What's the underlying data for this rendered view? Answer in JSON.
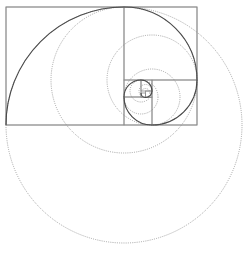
{
  "diagram": {
    "colors": {
      "background": "#ffffff",
      "rectangle_stroke": "#8a8a8a",
      "circle_stroke": "#9a9a9a",
      "spiral_stroke": "#4a4a4a"
    },
    "outer_rectangle": {
      "x": 6,
      "y": 7,
      "width": 191,
      "height": 118
    },
    "squares": [
      {
        "x": 6,
        "y": 7,
        "size": 118,
        "arc_center": [
          124,
          125
        ],
        "arc_start": [
          6,
          125
        ],
        "arc_end": [
          124,
          7
        ]
      },
      {
        "x": 124,
        "y": 7,
        "size": 73,
        "arc_center": [
          124,
          80
        ],
        "arc_start": [
          124,
          7
        ],
        "arc_end": [
          197,
          80
        ]
      },
      {
        "x": 152,
        "y": 80,
        "size": 45,
        "arc_center": [
          152,
          80
        ],
        "arc_start": [
          197,
          80
        ],
        "arc_end": [
          152,
          125
        ]
      },
      {
        "x": 124,
        "y": 97,
        "size": 28,
        "arc_center": [
          152,
          97
        ],
        "arc_start": [
          152,
          125
        ],
        "arc_end": [
          124,
          97
        ]
      },
      {
        "x": 124,
        "y": 80,
        "size": 17,
        "arc_center": [
          141,
          97
        ],
        "arc_start": [
          124,
          97
        ],
        "arc_end": [
          141,
          80
        ]
      },
      {
        "x": 141,
        "y": 80,
        "size": 11,
        "arc_center": [
          141,
          91
        ],
        "arc_start": [
          141,
          80
        ],
        "arc_end": [
          152,
          91
        ]
      },
      {
        "x": 145.5,
        "y": 91,
        "size": 6.5,
        "arc_center": [
          145.5,
          91
        ],
        "arc_start": [
          152,
          91
        ],
        "arc_end": [
          145.5,
          97.5
        ]
      },
      {
        "x": 141,
        "y": 93,
        "size": 4.5,
        "arc_center": [
          145.5,
          93
        ],
        "arc_start": [
          145.5,
          97.5
        ],
        "arc_end": [
          141,
          93
        ]
      }
    ]
  }
}
